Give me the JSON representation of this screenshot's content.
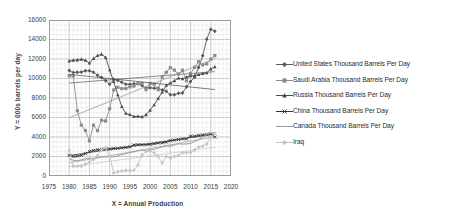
{
  "chart_data": {
    "type": "line",
    "title": "",
    "xlabel": "X = Annual Production",
    "ylabel": "Y = 000s barrels per day",
    "xlim": [
      1975,
      2020
    ],
    "ylim": [
      0,
      16000
    ],
    "xticks": [
      1975,
      1980,
      1985,
      1990,
      1995,
      2000,
      2005,
      2010,
      2015,
      2020
    ],
    "yticks": [
      0,
      2000,
      4000,
      6000,
      8000,
      10000,
      12000,
      14000,
      16000
    ],
    "grid": true,
    "legend_position": "right",
    "x": [
      1980,
      1981,
      1982,
      1983,
      1984,
      1985,
      1986,
      1987,
      1988,
      1989,
      1990,
      1991,
      1992,
      1993,
      1994,
      1995,
      1996,
      1997,
      1998,
      1999,
      2000,
      2001,
      2002,
      2003,
      2004,
      2005,
      2006,
      2007,
      2008,
      2009,
      2010,
      2011,
      2012,
      2013,
      2014,
      2015,
      2016
    ],
    "series": [
      {
        "name": "United States Thousand Barrels Per Day",
        "marker": "diamond",
        "color": "#595959",
        "values": [
          10809,
          10615,
          10639,
          10658,
          10794,
          10795,
          10639,
          10343,
          10090,
          9779,
          9420,
          9896,
          9787,
          9613,
          9411,
          9404,
          9453,
          9463,
          9283,
          8975,
          9059,
          8996,
          8990,
          8816,
          8690,
          8322,
          8331,
          8481,
          8514,
          9145,
          9690,
          10134,
          11117,
          12341,
          14017,
          15049,
          14840
        ]
      },
      {
        "name": "Saudi Arabia Thousand Barrels Per Day",
        "marker": "square",
        "color": "#8c8c8c",
        "values": [
          10270,
          10264,
          6695,
          5223,
          4663,
          3601,
          5208,
          4653,
          5718,
          5642,
          6903,
          8820,
          9098,
          8962,
          8965,
          9144,
          9226,
          9483,
          9502,
          8853,
          9491,
          9415,
          8854,
          10164,
          10638,
          11114,
          10859,
          10454,
          10846,
          9760,
          10520,
          11144,
          11726,
          11393,
          11505,
          11998,
          12349
        ]
      },
      {
        "name": "Russia Thousand Barrels Per Day",
        "marker": "triangle",
        "color": "#4a4a4a",
        "values": [
          11800,
          11870,
          11900,
          11970,
          11860,
          11580,
          12050,
          12350,
          12490,
          12160,
          10880,
          9680,
          8320,
          7120,
          6420,
          6290,
          6100,
          6120,
          6070,
          6280,
          6740,
          7300,
          7960,
          8600,
          9290,
          9550,
          9770,
          10040,
          9960,
          10140,
          10270,
          10280,
          10400,
          10510,
          10580,
          10980,
          11200
        ]
      },
      {
        "name": "China Thousand Barrels Per Day",
        "marker": "cross",
        "color": "#333333",
        "values": [
          2114,
          2012,
          2045,
          2120,
          2295,
          2505,
          2620,
          2690,
          2730,
          2760,
          2774,
          2828,
          2840,
          2890,
          2930,
          2990,
          3170,
          3211,
          3212,
          3213,
          3252,
          3306,
          3390,
          3409,
          3481,
          3627,
          3684,
          3743,
          3809,
          3805,
          4077,
          4073,
          4155,
          4216,
          4246,
          4309,
          3999
        ]
      },
      {
        "name": "Canada Thousand Barrels Per Day",
        "marker": "line",
        "color": "#9a9a9a",
        "values": [
          1764,
          1610,
          1560,
          1665,
          1775,
          1810,
          1805,
          1880,
          1985,
          1960,
          1965,
          1980,
          2065,
          2190,
          2290,
          2400,
          2480,
          2590,
          2680,
          2605,
          2720,
          2730,
          2880,
          2980,
          3080,
          3040,
          3200,
          3300,
          3270,
          3290,
          3340,
          3520,
          3740,
          3950,
          4270,
          4390,
          4460
        ]
      },
      {
        "name": "Iraq",
        "marker": "diamond-light",
        "color": "#c4c4c4",
        "values": [
          2646,
          1000,
          1012,
          1005,
          1209,
          1433,
          1690,
          2079,
          2685,
          2897,
          2040,
          305,
          425,
          512,
          553,
          560,
          579,
          1155,
          2150,
          2508,
          2571,
          2376,
          2004,
          1344,
          2011,
          1830,
          1999,
          2094,
          2385,
          2400,
          2400,
          2666,
          2983,
          3058,
          3285,
          3990,
          4380
        ]
      }
    ]
  },
  "axes": {
    "ylabel": "Y = 000s barrels per day",
    "xlabel": "X = Annual Production",
    "yticks": [
      "16000",
      "14000",
      "12000",
      "10000",
      "8000",
      "6000",
      "4000",
      "2000",
      "0"
    ],
    "xticks": [
      "1975",
      "1980",
      "1985",
      "1990",
      "1995",
      "2000",
      "2005",
      "2010",
      "2015",
      "2020"
    ]
  },
  "legend": {
    "items": [
      {
        "label": "United States Thousand Barrels Per Day",
        "marker": "diamond-marker-icon",
        "color": "#595959"
      },
      {
        "label": "Saudi Arabia Thousand Barrels Per Day",
        "marker": "square-marker-icon",
        "color": "#8c8c8c"
      },
      {
        "label": "Russia Thousand Barrels Per Day",
        "marker": "triangle-marker-icon",
        "color": "#4a4a4a"
      },
      {
        "label": "China Thousand Barrels Per Day",
        "marker": "cross-marker-icon",
        "color": "#333333"
      },
      {
        "label": "Canada Thousand Barrels Per Day",
        "marker": "line-marker-icon",
        "color": "#9a9a9a"
      },
      {
        "label": "Iraq",
        "marker": "diamond-light-marker-icon",
        "color": "#c4c4c4"
      }
    ]
  }
}
